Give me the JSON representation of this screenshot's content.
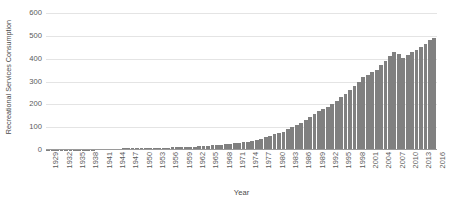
{
  "chart_data": {
    "type": "bar",
    "title": "",
    "xlabel": "Year",
    "ylabel": "Recreational Services Consumption",
    "ylim": [
      0,
      600
    ],
    "yticks": [
      0,
      100,
      200,
      300,
      400,
      500,
      600
    ],
    "ytick_labels": [
      "0",
      "100",
      "200",
      "300",
      "400",
      "500",
      "600"
    ],
    "grid": true,
    "legend": "none",
    "bar_color": "#808080",
    "gridline_color": "#e4e4e4",
    "axis_color": "#9a9a9a",
    "xtick_step": 3,
    "xtick_labels": [
      "1929",
      "1932",
      "1935",
      "1938",
      "1941",
      "1944",
      "1947",
      "1950",
      "1953",
      "1956",
      "1959",
      "1962",
      "1965",
      "1968",
      "1971",
      "1974",
      "1977",
      "1980",
      "1983",
      "1986",
      "1989",
      "1992",
      "1995",
      "1998",
      "2001",
      "2004",
      "2007",
      "2010",
      "2013",
      "2016"
    ],
    "categories": [
      "1929",
      "1930",
      "1931",
      "1932",
      "1933",
      "1934",
      "1935",
      "1936",
      "1937",
      "1938",
      "1939",
      "1940",
      "1941",
      "1942",
      "1943",
      "1944",
      "1945",
      "1946",
      "1947",
      "1948",
      "1949",
      "1950",
      "1951",
      "1952",
      "1953",
      "1954",
      "1955",
      "1956",
      "1957",
      "1958",
      "1959",
      "1960",
      "1961",
      "1962",
      "1963",
      "1964",
      "1965",
      "1966",
      "1967",
      "1968",
      "1969",
      "1970",
      "1971",
      "1972",
      "1973",
      "1974",
      "1975",
      "1976",
      "1977",
      "1978",
      "1979",
      "1980",
      "1981",
      "1982",
      "1983",
      "1984",
      "1985",
      "1986",
      "1987",
      "1988",
      "1989",
      "1990",
      "1991",
      "1992",
      "1993",
      "1994",
      "1995",
      "1996",
      "1997",
      "1998",
      "1999",
      "2000",
      "2001",
      "2002",
      "2003",
      "2004",
      "2005",
      "2006",
      "2007",
      "2008",
      "2009",
      "2010",
      "2011",
      "2012",
      "2013",
      "2014",
      "2015",
      "2016"
    ],
    "values": [
      2,
      2,
      2,
      1,
      1,
      1,
      2,
      2,
      2,
      2,
      2,
      3,
      3,
      4,
      4,
      5,
      5,
      7,
      7,
      7,
      7,
      8,
      8,
      9,
      9,
      10,
      11,
      11,
      12,
      12,
      13,
      14,
      14,
      15,
      16,
      17,
      18,
      20,
      21,
      23,
      25,
      27,
      29,
      32,
      35,
      37,
      41,
      45,
      50,
      56,
      62,
      68,
      75,
      81,
      90,
      100,
      110,
      120,
      132,
      145,
      158,
      170,
      178,
      190,
      202,
      216,
      230,
      246,
      263,
      282,
      300,
      318,
      330,
      340,
      352,
      372,
      392,
      412,
      428,
      420,
      405,
      415,
      428,
      440,
      452,
      466,
      480,
      492
    ]
  }
}
